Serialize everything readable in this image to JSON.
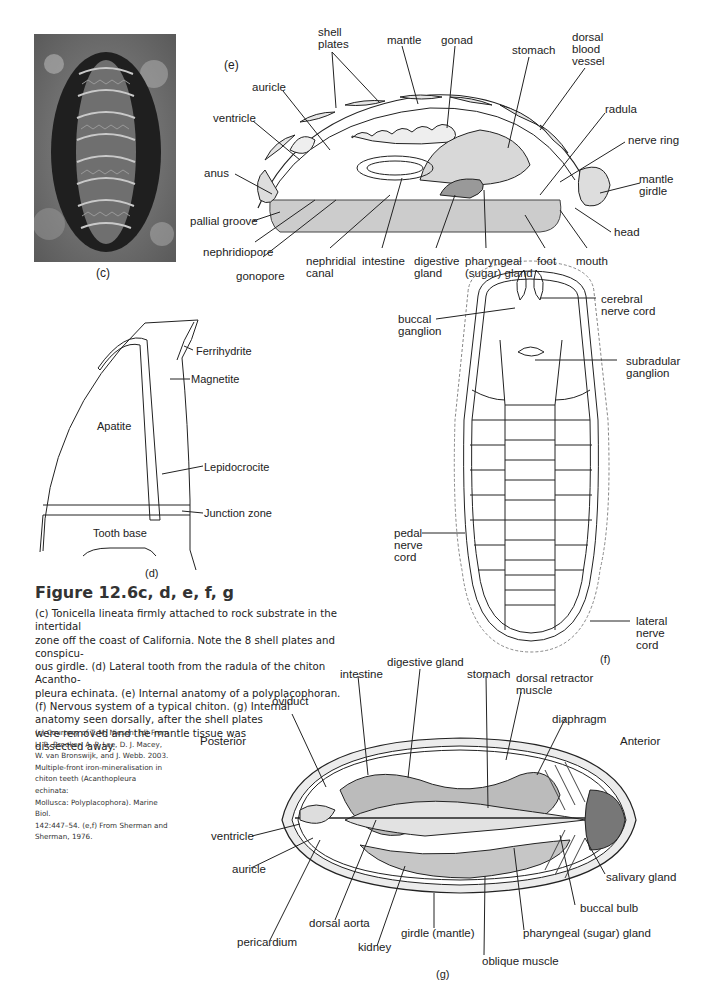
{
  "figure": {
    "title": "Figure 12.6c, d, e, f, g",
    "caption_lines": [
      "(c) Tonicella lineata firmly attached to rock substrate in the intertidal",
      "zone off the coast of California. Note the 8 shell plates and conspicu-",
      "ous girdle. (d) Lateral tooth from the radula of the chiton Acantho-",
      "pleura echinata. (e) Internal anatomy of a polyplacophoran.",
      "(f) Nervous system of a typical chiton. (g) Internal",
      "anatomy seen dorsally, after the shell plates",
      "were removed and the mantle tissue was",
      "dissected away."
    ],
    "credit_lines": [
      "(c) Courtesy of T. M. Niesen. (d) From",
      "L. R. Brooker, A. P. Lee, D. J. Macey,",
      "W. van Bronswijk, and J. Webb. 2003.",
      "Multiple-front iron-mineralisation in",
      "chiton teeth (Acanthopleura echinata:",
      "Mollusca: Polyplacophora). Marine Biol.",
      "142:447–54. (e,f) From Sherman and",
      "Sherman, 1976."
    ]
  },
  "panel_c": {
    "tag": "(c)"
  },
  "panel_d": {
    "tag": "(d)",
    "labels": {
      "ferrihydrite": "Ferrihydrite",
      "magnetite": "Magnetite",
      "apatite": "Apatite",
      "lepidocrocite": "Lepidocrocite",
      "junction_zone": "Junction zone",
      "tooth_base": "Tooth base"
    }
  },
  "panel_e": {
    "tag": "(e)",
    "labels": {
      "shell_plates": "shell\nplates",
      "mantle": "mantle",
      "gonad": "gonad",
      "stomach": "stomach",
      "dorsal_blood_vessel": "dorsal\nblood\nvessel",
      "auricle": "auricle",
      "ventricle": "ventricle",
      "radula": "radula",
      "nerve_ring": "nerve ring",
      "anus": "anus",
      "mantle_girdle": "mantle\ngirdle",
      "pallial_groove": "pallial groove",
      "head": "head",
      "nephridiopore": "nephridiopore",
      "gonopore": "gonopore",
      "nephridial_canal": "nephridial\ncanal",
      "intestine": "intestine",
      "digestive_gland": "digestive\ngland",
      "pharyngeal_gland": "pharyngeal\n(sugar) gland",
      "foot": "foot",
      "mouth": "mouth"
    }
  },
  "panel_f": {
    "tag": "(f)",
    "labels": {
      "cerebral_nerve_cord": "cerebral\nnerve cord",
      "buccal_ganglion": "buccal\nganglion",
      "subradular_ganglion": "subradular\nganglion",
      "pedal_nerve_cord": "pedal\nnerve\ncord",
      "lateral_nerve_cord": "lateral\nnerve\ncord"
    }
  },
  "panel_g": {
    "tag": "(g)",
    "labels": {
      "posterior": "Posterior",
      "anterior": "Anterior",
      "oviduct": "oviduct",
      "intestine": "intestine",
      "digestive_gland": "digestive gland",
      "stomach": "stomach",
      "dorsal_retractor_muscle": "dorsal retractor\nmuscle",
      "diaphragm": "diaphragm",
      "ventricle": "ventricle",
      "auricle": "auricle",
      "salivary_gland": "salivary gland",
      "buccal_bulb": "buccal bulb",
      "pericardium": "pericardium",
      "dorsal_aorta": "dorsal aorta",
      "kidney": "kidney",
      "girdle_mantle": "girdle (mantle)",
      "pharyngeal_gland": "pharyngeal (sugar) gland",
      "oblique_muscle": "oblique muscle"
    }
  }
}
